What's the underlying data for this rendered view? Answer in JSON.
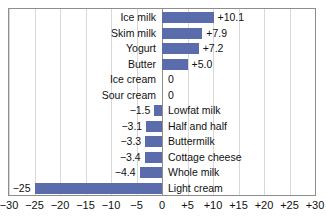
{
  "chart_data": {
    "type": "bar",
    "orientation": "horizontal",
    "title": "",
    "subtitle": "",
    "xlabel": "",
    "ylabel": "",
    "xlim": [
      -30,
      30
    ],
    "grid": true,
    "legend": null,
    "bar_color": "#5a6cac",
    "axis_color": "#8e8e8e",
    "grid_color": "#d8d8d8",
    "xticks": [
      -30,
      -25,
      -20,
      -15,
      -10,
      -5,
      0,
      5,
      10,
      15,
      20,
      25,
      30
    ],
    "xtick_labels": [
      "−30",
      "−25",
      "−20",
      "−15",
      "−10",
      "−5",
      "0",
      "+5",
      "+10",
      "+15",
      "+20",
      "+25",
      "+30"
    ],
    "categories": [
      "Ice milk",
      "Skim milk",
      "Yogurt",
      "Butter",
      "Ice cream",
      "Sour cream",
      "Lowfat milk",
      "Half and half",
      "Buttermilk",
      "Cottage cheese",
      "Whole milk",
      "Light cream"
    ],
    "values": [
      10.1,
      7.9,
      7.2,
      5.0,
      0,
      0,
      -1.5,
      -3.1,
      -3.3,
      -3.4,
      -4.4,
      -25
    ],
    "value_labels": [
      "+10.1",
      "+7.9",
      "+7.2",
      "+5.0",
      "0",
      "0",
      "−1.5",
      "−3.1",
      "−3.3",
      "−3.4",
      "−4.4",
      "−25"
    ],
    "bars": [
      {
        "label": "Ice milk",
        "value": 10.1,
        "value_label": "+10.1"
      },
      {
        "label": "Skim milk",
        "value": 7.9,
        "value_label": "+7.9"
      },
      {
        "label": "Yogurt",
        "value": 7.2,
        "value_label": "+7.2"
      },
      {
        "label": "Butter",
        "value": 5.0,
        "value_label": "+5.0"
      },
      {
        "label": "Ice cream",
        "value": 0,
        "value_label": "0"
      },
      {
        "label": "Sour cream",
        "value": 0,
        "value_label": "0"
      },
      {
        "label": "Lowfat milk",
        "value": -1.5,
        "value_label": "−1.5"
      },
      {
        "label": "Half and half",
        "value": -3.1,
        "value_label": "−3.1"
      },
      {
        "label": "Buttermilk",
        "value": -3.3,
        "value_label": "−3.3"
      },
      {
        "label": "Cottage cheese",
        "value": -3.4,
        "value_label": "−3.4"
      },
      {
        "label": "Whole milk",
        "value": -4.4,
        "value_label": "−4.4"
      },
      {
        "label": "Light cream",
        "value": -25,
        "value_label": "−25"
      }
    ]
  }
}
